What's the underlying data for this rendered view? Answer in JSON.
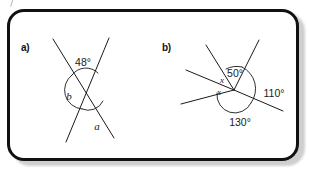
{
  "page": {
    "kind": "geometry-worksheet-panel",
    "background_color": "#ffffff",
    "border_color": "#111111",
    "shadow_color": "#cfcfcf"
  },
  "parts": [
    {
      "id": "a",
      "label": "a)",
      "description": "Two straight lines crossing at a single point forming an X, with vertically opposite and adjacent angles marked.",
      "angles": [
        {
          "name": "top-angle",
          "text": "48°",
          "value": 48,
          "unit": "degrees",
          "position": "top"
        },
        {
          "name": "left-angle",
          "text": "b",
          "value": null,
          "unit": "variable",
          "position": "left"
        },
        {
          "name": "bottom-angle",
          "text": "a",
          "value": null,
          "unit": "variable",
          "position": "bottom"
        }
      ]
    },
    {
      "id": "b",
      "label": "b)",
      "description": "Several rays meeting at one vertex; angles around the point are labelled.",
      "angles": [
        {
          "name": "upper-angle",
          "text": "50°",
          "value": 50,
          "unit": "degrees",
          "position": "upper"
        },
        {
          "name": "right-angle",
          "text": "110°",
          "value": 110,
          "unit": "degrees",
          "position": "right"
        },
        {
          "name": "lower-angle",
          "text": "130°",
          "value": 130,
          "unit": "degrees",
          "position": "lower"
        },
        {
          "name": "unknown-angle-upper",
          "text": "x",
          "value": null,
          "unit": "variable",
          "position": "left-upper"
        },
        {
          "name": "unknown-angle-lower",
          "text": "x",
          "value": null,
          "unit": "variable",
          "position": "left-lower"
        }
      ]
    }
  ]
}
